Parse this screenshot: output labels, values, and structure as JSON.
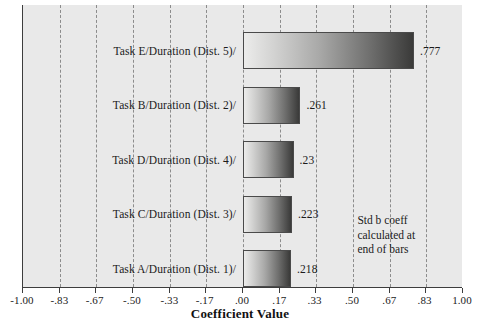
{
  "chart_data": {
    "type": "bar",
    "orientation": "horizontal",
    "title": "",
    "xlabel": "Coefficient Value",
    "ylabel": "",
    "xlim": [
      -1.0,
      1.0
    ],
    "grid": true,
    "legend": null,
    "categories": [
      "Task E/Duration (Dist. 5)/",
      "Task B/Duration (Dist. 2)/",
      "Task D/Duration (Dist. 4)/",
      "Task C/Duration (Dist. 3)/",
      "Task A/Duration (Dist. 1)/"
    ],
    "values": [
      0.777,
      0.261,
      0.23,
      0.223,
      0.218
    ],
    "value_labels": [
      ".777",
      ".261",
      ".23",
      ".223",
      ".218"
    ],
    "xticks": [
      -1.0,
      -0.83,
      -0.67,
      -0.5,
      -0.33,
      -0.17,
      0.0,
      0.17,
      0.33,
      0.5,
      0.67,
      0.83,
      1.0
    ],
    "xtick_labels": [
      "-1.00",
      "-.83",
      "-.67",
      "-.50",
      "-.33",
      "-.17",
      ".00",
      ".17",
      ".33",
      ".50",
      ".67",
      ".83",
      "1.00"
    ],
    "annotation": {
      "lines": [
        "Std b coeff",
        "calculated at",
        "end of bars"
      ]
    },
    "colors": {
      "panel_background": "#e9e9e9",
      "gridline": "#8c8c8c",
      "axis": "#3d3d3d",
      "bar_gradient_start": "#ececeb",
      "bar_gradient_end": "#3a3a39",
      "text": "#1b1b1b"
    }
  }
}
